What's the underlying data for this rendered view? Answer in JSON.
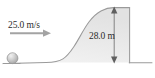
{
  "figure": {
    "type": "physics-projectile-hill-diagram",
    "background_color": "#ffffff",
    "labels": {
      "initial_speed": "25.0 m/s",
      "cliff_height": "28.0 m"
    },
    "annotations": {
      "velocity_arrow": "horizontal-right-arrow",
      "dimension_arrow": "vertical-double-headed-arrow"
    },
    "objects": {
      "ball": "sphere",
      "terrain": "hill-with-vertical-cliff",
      "ground": "horizontal-ground-line"
    },
    "colors": {
      "outline": "#9a9a9a",
      "hill_fill": "#e9e9e9",
      "ball_fill": "#c9c9c9",
      "text": "#2b2b2b",
      "arrow": "#9a9a9a"
    }
  }
}
